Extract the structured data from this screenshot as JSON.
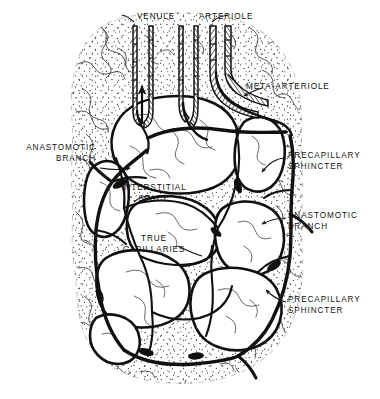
{
  "figure": {
    "type": "anatomical-line-diagram",
    "colors": {
      "ink": "#111111",
      "background": "#ffffff",
      "tissue_stipple": "#2a2a2a"
    }
  },
  "labels": {
    "venule": "VENULE",
    "arteriole": "ARTERIOLE",
    "meta_arteriole": "META-ARTERIOLE",
    "anastomotic_branch_left": "ANASTOMOTIC\nBRANCH",
    "anastomotic_branch_right": "ANASTOMOTIC\nBRANCH",
    "precapillary_sphincter_upper": "PRECAPILLARY\nSPHINCTER",
    "precapillary_sphincter_lower": "PRECAPILLARY\nSPHINCTER",
    "interstitial_space": "INTERSTITIAL\nSPACE",
    "true_capillaries": "TRUE\nCAPILLARIES"
  },
  "structures": [
    {
      "name": "venule",
      "kind": "vessel-tube",
      "wall": "hatched",
      "flow": "outflow"
    },
    {
      "name": "arteriole",
      "kind": "vessel-tube",
      "wall": "hatched",
      "flow": "inflow"
    },
    {
      "name": "meta-arteriole",
      "kind": "vessel-tube",
      "wall": "hatched",
      "flow": "inflow"
    },
    {
      "name": "true-capillaries",
      "kind": "capillary-network",
      "wall": "thin",
      "flow": "distributed"
    },
    {
      "name": "precapillary-sphincter",
      "kind": "sphincter",
      "count": 6
    },
    {
      "name": "anastomotic-branch",
      "kind": "shunt",
      "count": 2
    },
    {
      "name": "interstitial-space",
      "kind": "tissue-field",
      "texture": "stippled"
    }
  ]
}
